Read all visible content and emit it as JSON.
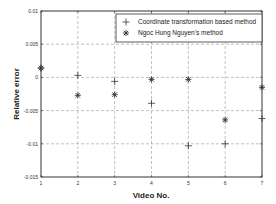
{
  "chart_data": {
    "type": "scatter",
    "title": "",
    "xlabel": "Video No.",
    "ylabel": "Relative error",
    "xlim": [
      1,
      7
    ],
    "ylim": [
      -0.015,
      0.01
    ],
    "grid": true,
    "legend_position": "top-right",
    "x_ticks": [
      "1",
      "2",
      "3",
      "4",
      "5",
      "6",
      "7"
    ],
    "y_ticks": [
      "0.01",
      "0.005",
      "0",
      "-0.005",
      "-0.01",
      "-0.015"
    ],
    "x_tick_values": [
      1,
      2,
      3,
      4,
      5,
      6,
      7
    ],
    "y_tick_values": [
      0.01,
      0.005,
      0,
      -0.005,
      -0.01,
      -0.015
    ],
    "series": [
      {
        "name": "Coordinate transformation based method",
        "marker": "plus",
        "x": [
          1,
          2,
          3,
          4,
          5,
          6,
          7
        ],
        "values": [
          0.0014,
          0.0003,
          -0.0006,
          -0.0039,
          -0.0103,
          -0.01,
          -0.0062
        ]
      },
      {
        "name": "Ngoc Hung Nguyen’s method",
        "marker": "asterisk",
        "x": [
          1,
          2,
          3,
          4,
          5,
          6,
          7
        ],
        "values": [
          0.0014,
          -0.0027,
          -0.0026,
          -0.0003,
          -0.0003,
          -0.0064,
          -0.0015
        ]
      }
    ],
    "colors": {
      "axes": "#333333",
      "grid": "#999999",
      "markers": "#333333"
    }
  }
}
